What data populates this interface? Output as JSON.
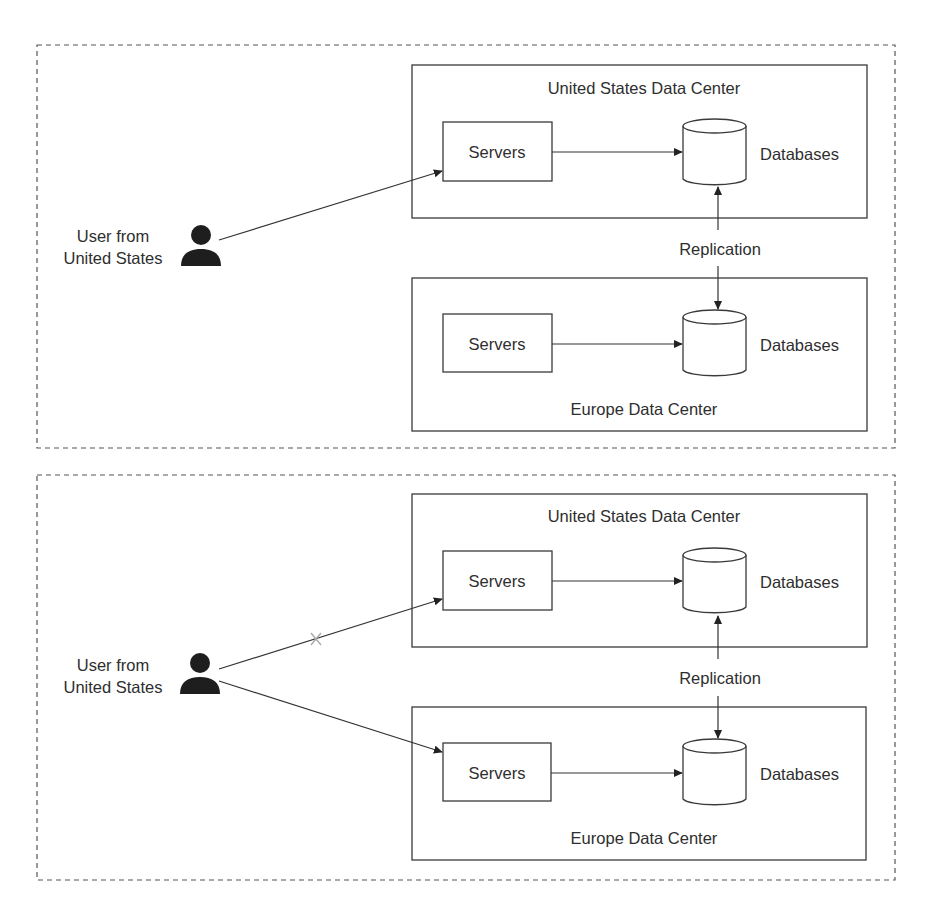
{
  "panels": [
    {
      "id": "normal-operation",
      "user": {
        "line1": "User from",
        "line2": "United States"
      },
      "us_dc": {
        "title": "United States Data Center",
        "servers": "Servers",
        "databases": "Databases"
      },
      "eu_dc": {
        "title": "Europe Data Center",
        "servers": "Servers",
        "databases": "Databases"
      },
      "replication": "Replication",
      "connections": [
        {
          "from": "user",
          "to": "us_servers",
          "status": "active"
        }
      ]
    },
    {
      "id": "us-failover",
      "user": {
        "line1": "User from",
        "line2": "United States"
      },
      "us_dc": {
        "title": "United States Data Center",
        "servers": "Servers",
        "databases": "Databases"
      },
      "eu_dc": {
        "title": "Europe Data Center",
        "servers": "Servers",
        "databases": "Databases"
      },
      "replication": "Replication",
      "connections": [
        {
          "from": "user",
          "to": "us_servers",
          "status": "failed",
          "marker": "×"
        },
        {
          "from": "user",
          "to": "eu_servers",
          "status": "active"
        }
      ]
    }
  ],
  "colors": {
    "stroke": "#333333",
    "failed_marker": "#aaaaaa",
    "text": "#2e2e2e",
    "background": "#ffffff"
  }
}
